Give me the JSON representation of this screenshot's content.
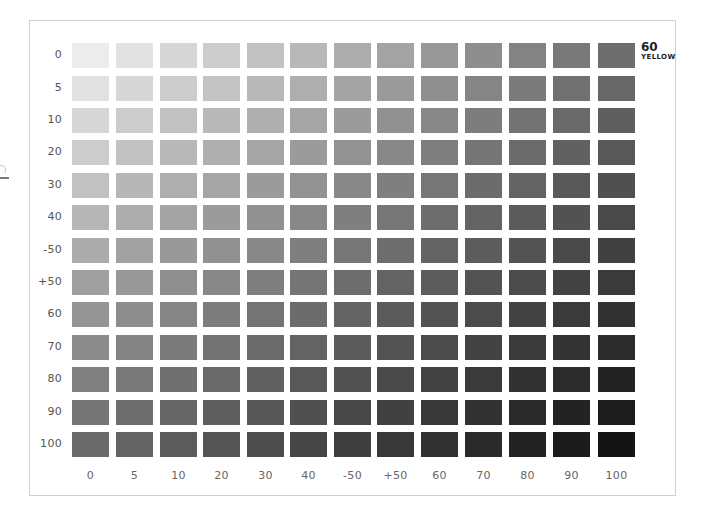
{
  "chart_data": {
    "type": "heatmap",
    "title": "60 YELLOW",
    "title_number": "60",
    "title_name": "YELLOW",
    "xlabel": "",
    "ylabel": "",
    "row_labels": [
      "0",
      "5",
      "10",
      "20",
      "30",
      "40",
      "-50",
      "+50",
      "60",
      "70",
      "80",
      "90",
      "100"
    ],
    "col_labels": [
      "0",
      "5",
      "10",
      "20",
      "30",
      "40",
      "-50",
      "+50",
      "60",
      "70",
      "80",
      "90",
      "100"
    ],
    "cell_description": "Grayscale tint swatch; darkness increases with both row and column value",
    "corner_gray_hex": {
      "top_left": "#ececec",
      "top_right": "#6e6e6e",
      "bottom_left": "#6a6a6a",
      "bottom_right": "#141414"
    },
    "grid": false,
    "legend": "none"
  },
  "frame": {
    "border_color": "#cfcfcf",
    "background": "#ffffff"
  },
  "layout": {
    "col_x": [
      72,
      116,
      160,
      203,
      247,
      290,
      334,
      377,
      421,
      465,
      509,
      553,
      598
    ],
    "row_y": [
      43,
      76,
      108,
      140,
      173,
      205,
      238,
      270,
      302,
      335,
      367,
      400,
      432
    ],
    "swatch_w": 37,
    "swatch_h": 25,
    "row_label_x": 22,
    "col_label_y": 469
  }
}
